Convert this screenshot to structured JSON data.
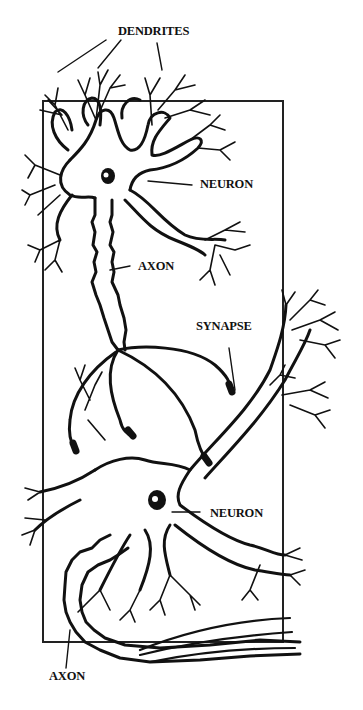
{
  "diagram": {
    "labels": {
      "dendrites": "DENDRITES",
      "neuron_top": "NEURON",
      "axon_top": "AXON",
      "synapse": "SYNAPSE",
      "neuron_bottom": "NEURON",
      "axon_bottom": "AXON"
    },
    "colors": {
      "ink": "#111111",
      "background": "#ffffff"
    }
  }
}
